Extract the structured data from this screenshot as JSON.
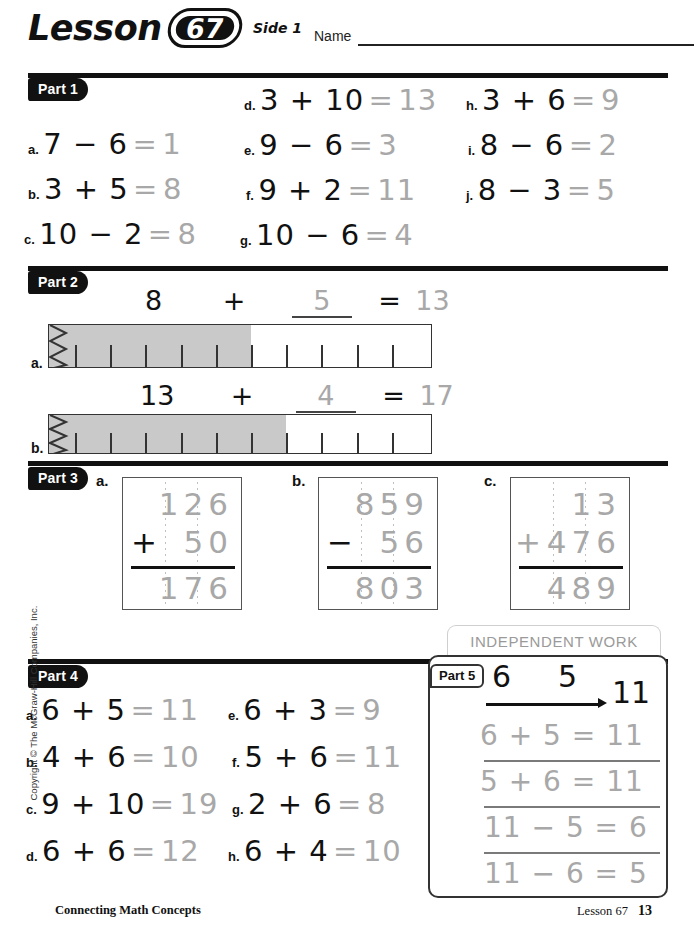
{
  "header": {
    "lesson_word": "Lesson",
    "lesson_number": "67",
    "side_label": "Side 1",
    "name_label": "Name"
  },
  "part1": {
    "badge": "Part 1",
    "items": [
      {
        "letter": "a.",
        "expr": "7 − 6",
        "eq": "=",
        "answer": "1"
      },
      {
        "letter": "b.",
        "expr": "3 + 5",
        "eq": "=",
        "answer": "8"
      },
      {
        "letter": "c.",
        "expr": "10 − 2",
        "eq": "=",
        "answer": "8"
      },
      {
        "letter": "d.",
        "expr": "3 + 10",
        "eq": "=",
        "answer": "13"
      },
      {
        "letter": "e.",
        "expr": "9 − 6",
        "eq": "=",
        "answer": "3"
      },
      {
        "letter": "f.",
        "expr": "9 + 2",
        "eq": "=",
        "answer": "11"
      },
      {
        "letter": "g.",
        "expr": "10 − 6",
        "eq": "=",
        "answer": "4"
      },
      {
        "letter": "h.",
        "expr": "3 + 6",
        "eq": "=",
        "answer": "9"
      },
      {
        "letter": "i.",
        "expr": "8 − 6",
        "eq": "=",
        "answer": "2"
      },
      {
        "letter": "j.",
        "expr": "8 − 3",
        "eq": "=",
        "answer": "5"
      }
    ]
  },
  "part2": {
    "badge": "Part 2",
    "items": [
      {
        "letter": "a.",
        "start": "8",
        "plus": "+",
        "blank_value": "5",
        "equals": "=",
        "total": "13",
        "shaded_ticks": 5,
        "open_ticks": 5,
        "fill_fraction": 0.555
      },
      {
        "letter": "b.",
        "start": "13",
        "plus": "+",
        "blank_value": "4",
        "equals": "=",
        "total": "17",
        "shaded_ticks": 6,
        "open_ticks": 4,
        "fill_fraction": 0.645
      }
    ]
  },
  "part3": {
    "badge": "Part 3",
    "items": [
      {
        "letter": "a.",
        "operator": "+",
        "top": "126",
        "bottom": "50",
        "answer": "176"
      },
      {
        "letter": "b.",
        "operator": "−",
        "top": "859",
        "bottom": "56",
        "answer": "803"
      },
      {
        "letter": "c.",
        "operator": "+",
        "top": "13",
        "bottom": "476",
        "answer": "489"
      }
    ]
  },
  "part4": {
    "badge": "Part 4",
    "items": [
      {
        "letter": "a.",
        "expr": "6 + 5",
        "eq": "=",
        "answer": "11"
      },
      {
        "letter": "b.",
        "expr": "4 + 6",
        "eq": "=",
        "answer": "10"
      },
      {
        "letter": "c.",
        "expr": "9 + 10",
        "eq": "=",
        "answer": "19"
      },
      {
        "letter": "d.",
        "expr": "6 + 6",
        "eq": "=",
        "answer": "12"
      },
      {
        "letter": "e.",
        "expr": "6 + 3",
        "eq": "=",
        "answer": "9"
      },
      {
        "letter": "f.",
        "expr": "5 + 6",
        "eq": "=",
        "answer": "11"
      },
      {
        "letter": "g.",
        "expr": "2 + 6",
        "eq": "=",
        "answer": "8"
      },
      {
        "letter": "h.",
        "expr": "6 + 4",
        "eq": "=",
        "answer": "10"
      }
    ]
  },
  "independent_work": {
    "label": "INDEPENDENT WORK"
  },
  "part5": {
    "badge": "Part 5",
    "number_family": {
      "small1": "6",
      "small2": "5",
      "total": "11"
    },
    "facts": [
      "6 + 5 = 11",
      "5 + 6 = 11",
      "11 − 5 = 6",
      "11 − 6 = 5"
    ]
  },
  "footer": {
    "series": "Connecting Math Concepts",
    "lesson": "Lesson 67",
    "page": "13"
  },
  "copyright": "Copyright © The McGraw-Hill Companies, Inc.",
  "colors": {
    "print": "#111111",
    "handwriting": "#a8a8a8",
    "bar_fill": "#c9c9c9",
    "badge_bg": "#111111"
  }
}
